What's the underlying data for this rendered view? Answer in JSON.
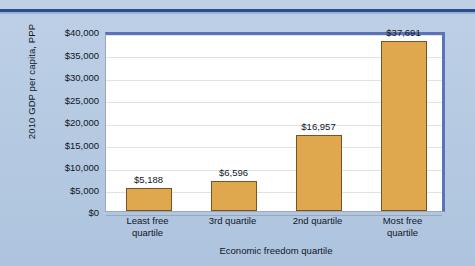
{
  "chart_data": {
    "type": "bar",
    "title": "",
    "xlabel": "Economic freedom quartile",
    "ylabel": "2010 GDP per capita, PPP",
    "categories": [
      "Least free quartile",
      "3rd quartile",
      "2nd quartile",
      "Most free quartile"
    ],
    "category_lines": [
      [
        "Least free",
        "quartile"
      ],
      [
        "3rd quartile",
        ""
      ],
      [
        "2nd quartile",
        ""
      ],
      [
        "Most free",
        "quartile"
      ]
    ],
    "values": [
      5188,
      6596,
      16957,
      37691
    ],
    "value_labels": [
      "$5,188",
      "$6,596",
      "$16,957",
      "$37,691"
    ],
    "ylim": [
      0,
      40000
    ],
    "ytick_values": [
      0,
      5000,
      10000,
      15000,
      20000,
      25000,
      30000,
      35000,
      40000
    ],
    "ytick_labels": [
      "$0",
      "$5,000",
      "$10,000",
      "$15,000",
      "$20,000",
      "$25,000",
      "$30,000",
      "$35,000",
      "$40,000"
    ],
    "grid": true,
    "legend": false,
    "legend_position": "none",
    "colors": {
      "bar_fill": "#dfa84f",
      "bar_border": "#7a5320",
      "plot_background": "#ffffff",
      "page_background": "#b9cde4",
      "plot_border": "#5b73b8",
      "gridline": "#e2e2e6",
      "text": "#10161f",
      "top_rule": "#2b4d8e"
    }
  }
}
